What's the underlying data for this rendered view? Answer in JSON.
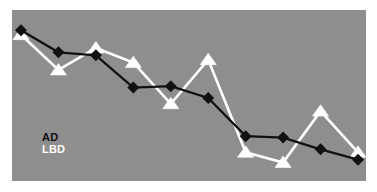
{
  "chart_data": {
    "type": "line",
    "title": "",
    "subtitle": "",
    "xlabel": "",
    "ylabel": "",
    "grid": false,
    "legend_position": "inside-bottom-left",
    "background_color": "#8e8e8e",
    "xlim": [
      0,
      9
    ],
    "ylim": [
      0,
      100
    ],
    "x": [
      0,
      1,
      2,
      3,
      4,
      5,
      6,
      7,
      8,
      9
    ],
    "categories": [
      "1",
      "2",
      "3",
      "4",
      "5",
      "6",
      "7",
      "8",
      "9",
      "10"
    ],
    "series": [
      {
        "name": "AD",
        "color": "#111111",
        "marker": "diamond",
        "marker_color": "#111111",
        "values": [
          93,
          78,
          76,
          54,
          55,
          47,
          21,
          20,
          12,
          5
        ]
      },
      {
        "name": "LBD",
        "color": "#ffffff",
        "marker": "triangle",
        "marker_color": "#ffffff",
        "values": [
          90,
          66,
          81,
          71,
          43,
          73,
          10,
          3,
          38,
          10
        ]
      }
    ],
    "annotations": []
  },
  "legend": {
    "items": [
      {
        "label": "AD",
        "color": "#111111"
      },
      {
        "label": "LBD",
        "color": "#ffffff"
      }
    ]
  }
}
